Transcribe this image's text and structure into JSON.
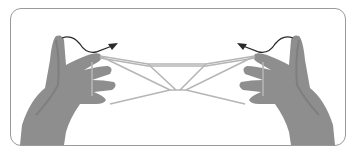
{
  "illustration": {
    "subject": "two hands holding a string figure",
    "colors": {
      "frame_border": "#9a9a9a",
      "hand": "#8e8e8e",
      "hand_shade": "#6f6f6f",
      "string": "#b5b5b5",
      "arrow": "#2a2a2a"
    },
    "arrows": [
      "arrow-left-up",
      "arrow-right-up"
    ]
  }
}
